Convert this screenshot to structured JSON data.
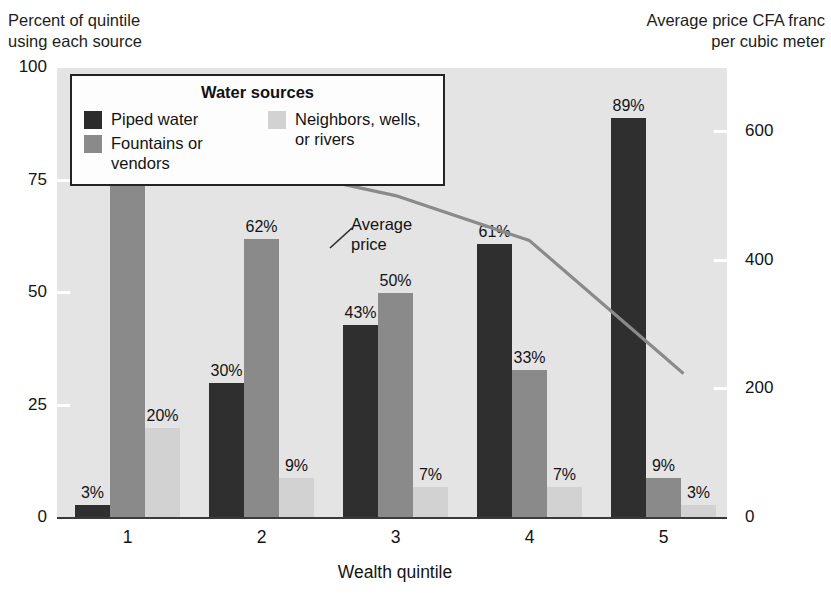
{
  "chart_data": {
    "type": "bar",
    "title": "",
    "categories": [
      "1",
      "2",
      "3",
      "4",
      "5"
    ],
    "xlabel": "Wealth quintile",
    "ylabel": "Percent of quintile\nusing each source",
    "ylabel_right": "Average price CFA franc\nper cubic meter",
    "ylim": [
      0,
      100
    ],
    "ylim_right": [
      0,
      700
    ],
    "yticks": [
      "0",
      "25",
      "50",
      "75",
      "100"
    ],
    "ytick_values": [
      0,
      25,
      50,
      75,
      100
    ],
    "yticks_right": [
      "0",
      "200",
      "400",
      "600"
    ],
    "ytick_values_right": [
      0,
      200,
      400,
      600
    ],
    "grid": false,
    "legend_position": "upper-left-inside",
    "legend_title": "Water sources",
    "series": [
      {
        "name": "Piped water",
        "color": "#2f2f2f",
        "values": [
          3,
          30,
          43,
          61,
          89
        ],
        "labels": [
          "3%",
          "30%",
          "43%",
          "61%",
          "89%"
        ]
      },
      {
        "name": "Fountains or\nvendors",
        "color": "#8a8a8a",
        "values": [
          77,
          62,
          50,
          33,
          9
        ],
        "labels": [
          "77%",
          "62%",
          "50%",
          "33%",
          "9%"
        ]
      },
      {
        "name": "Neighbors, wells,\nor rivers",
        "color": "#d2d2d2",
        "values": [
          20,
          9,
          7,
          7,
          3
        ],
        "labels": [
          "20%",
          "9%",
          "7%",
          "7%",
          "3%"
        ]
      }
    ],
    "line_series": {
      "name": "Average price",
      "color": "#8a8a8a",
      "annotation": "Average\nprice",
      "values": [
        640,
        545,
        500,
        430,
        250
      ]
    }
  },
  "legend": {
    "title": "Water sources",
    "entries": [
      {
        "label": "Piped water",
        "swatch": "piped"
      },
      {
        "label": "Fountains or\nvendors",
        "swatch": "fountains"
      },
      {
        "label": "Neighbors, wells,\nor rivers",
        "swatch": "neighbors"
      }
    ]
  },
  "captions": {
    "left": "Percent of quintile\nusing each source",
    "right": "Average price CFA franc\nper cubic meter"
  }
}
